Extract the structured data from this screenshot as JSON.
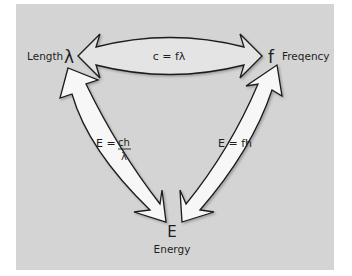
{
  "diagram": {
    "nodes": {
      "length": {
        "label": "Length",
        "symbol": "λ"
      },
      "frequency": {
        "label": "Freqency",
        "symbol": "f"
      },
      "energy": {
        "label": "Energy",
        "symbol": "E"
      }
    },
    "relations": {
      "length_frequency": "c = fλ",
      "length_energy_lhs": "E =",
      "length_energy_num": "ch",
      "length_energy_den": "λ",
      "frequency_energy": "E = fh"
    }
  },
  "colors": {
    "panel": "#d4d4d4",
    "arrow_fill_top": "#e4e4e4",
    "arrow_fill_side": "#f7f7f7",
    "stroke": "#1a1a1a",
    "text": "#1e1e1e"
  }
}
